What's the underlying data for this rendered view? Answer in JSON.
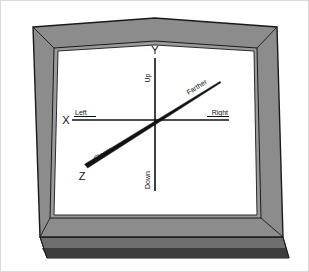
{
  "figure": {
    "kind": "3d-coordinate-axes-on-framed-screen",
    "background_color": "#ffffff",
    "border_color": "#d9d9d9"
  },
  "frame": {
    "name": "picture-frame-bezel",
    "face_color": "#8c8c8c",
    "edge_color": "#1a1a1a",
    "bottom_depth_color": "#6f6f6f",
    "bottom_shadow_color": "#3a3a3a",
    "inner_bevel_color": "#9a9a9a",
    "screen_color": "#ffffff"
  },
  "diagram": {
    "title": "",
    "origin": {
      "x": 155,
      "y": 120
    },
    "axes": [
      {
        "id": "y",
        "name": "vertical-axis",
        "letter": "Y",
        "letter_pos": {
          "x": 155,
          "y": 52
        },
        "positive_label": "Up",
        "positive_label_pos": {
          "x": 149,
          "y": 75
        },
        "negative_label": "Down",
        "negative_label_pos": {
          "x": 149,
          "y": 182
        },
        "x1": 155,
        "y1": 58,
        "x2": 155,
        "y2": 191,
        "stroke": "#111111",
        "stroke_width": 1.6
      },
      {
        "id": "x",
        "name": "horizontal-axis",
        "letter": "X",
        "letter_pos": {
          "x": 66,
          "y": 122
        },
        "positive_label": "Right",
        "positive_label_pos": {
          "x": 224,
          "y": 117
        },
        "negative_label": "Left",
        "negative_label_pos": {
          "x": 76,
          "y": 113
        },
        "x1": 72,
        "y1": 120,
        "x2": 229,
        "y2": 120,
        "stroke": "#111111",
        "stroke_width": 1.6
      },
      {
        "id": "z",
        "name": "depth-axis",
        "letter": "Z",
        "letter_pos": {
          "x": 83,
          "y": 177
        },
        "positive_label": "Farther",
        "positive_label_pos": {
          "x": 196,
          "y": 86
        },
        "negative_label": "Closer",
        "negative_label_pos": {
          "x": 100,
          "y": 155
        },
        "x1": 220,
        "y1": 82,
        "x2": 86,
        "y2": 166,
        "stroke": "#111111",
        "near_end_stroke_width": 3.4,
        "far_end_stroke_width": 1.1,
        "rotation_deg": -32
      }
    ],
    "label_font_size": 7,
    "letter_font_size": 11
  },
  "legend_note": ""
}
